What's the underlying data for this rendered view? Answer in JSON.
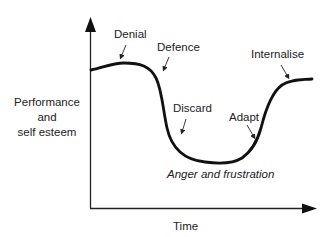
{
  "diagram": {
    "y_axis_label": [
      "Performance",
      "and",
      "self esteem"
    ],
    "x_axis_label": "Time",
    "stages": [
      {
        "label": "Denial"
      },
      {
        "label": "Defence"
      },
      {
        "label": "Discard"
      },
      {
        "label": "Adapt"
      },
      {
        "label": "Internalise"
      }
    ],
    "trough_label": "Anger and frustration",
    "colors": {
      "line": "#111111",
      "text": "#222222",
      "background": "#ffffff"
    }
  }
}
